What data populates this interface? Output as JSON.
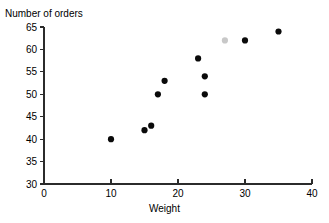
{
  "chart_data": {
    "type": "scatter",
    "title": "",
    "xlabel": "Weight",
    "ylabel": "Number of orders",
    "xlim": [
      0,
      40
    ],
    "ylim": [
      30,
      65
    ],
    "xticks": [
      "0",
      "10",
      "20",
      "30",
      "40"
    ],
    "yticks": [
      "30",
      "35",
      "40",
      "45",
      "50",
      "55",
      "60",
      "65"
    ],
    "xtick_values": [
      0,
      10,
      20,
      30,
      40
    ],
    "ytick_values": [
      30,
      35,
      40,
      45,
      50,
      55,
      60,
      65
    ],
    "grid": false,
    "legend": null,
    "marker": "filled-circle",
    "marker_color": "#0a0a0a",
    "points": [
      {
        "x": 10,
        "y": 40
      },
      {
        "x": 15,
        "y": 42
      },
      {
        "x": 16,
        "y": 43
      },
      {
        "x": 17,
        "y": 50
      },
      {
        "x": 18,
        "y": 53
      },
      {
        "x": 23,
        "y": 58
      },
      {
        "x": 24,
        "y": 54
      },
      {
        "x": 24,
        "y": 50
      },
      {
        "x": 27,
        "y": 62,
        "faint": true
      },
      {
        "x": 30,
        "y": 62
      },
      {
        "x": 35,
        "y": 64
      }
    ]
  },
  "axes": {
    "y_title": "Number of orders",
    "x_title": "Weight"
  }
}
